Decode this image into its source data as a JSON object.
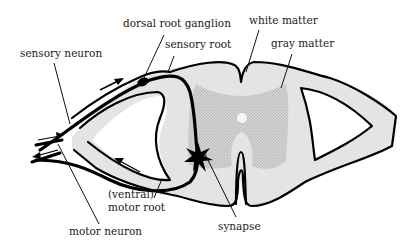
{
  "figure": {
    "colors": {
      "white_matter": "#e4e4e4",
      "gray_matter": "#c8c8c8",
      "outline": "#000000",
      "background": "#ffffff"
    },
    "labels": {
      "dorsal_root_ganglion": "dorsal root ganglion",
      "sensory_root": "sensory root",
      "white_matter": "white matter",
      "gray_matter": "gray matter",
      "sensory_neuron": "sensory neuron",
      "ventral_prefix": "(ventral)",
      "motor_root": "motor root",
      "motor_neuron": "motor neuron",
      "synapse": "synapse"
    },
    "arrows": [
      {
        "name": "sensory-direction-arrow",
        "direction": "toward spinal cord"
      },
      {
        "name": "motor-direction-arrow",
        "direction": "away from spinal cord"
      }
    ]
  }
}
